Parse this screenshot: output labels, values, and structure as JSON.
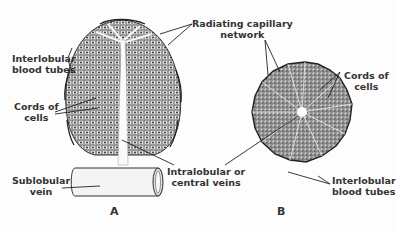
{
  "figure": {
    "panels": [
      {
        "id": "A",
        "caption": "A",
        "view": "longitudinal section of liver lobule"
      },
      {
        "id": "B",
        "caption": "B",
        "view": "cross section of liver lobule"
      }
    ],
    "labels": {
      "radiating_capillary_network": {
        "line1": "Radiating capillary",
        "line2": "network"
      },
      "interlobular_blood_tubes_a": {
        "line1": "Interlobular",
        "line2": "blood tubes"
      },
      "cords_of_cells_a": {
        "line1": "Cords of",
        "line2": "cells"
      },
      "sublobular_vein": {
        "line1": "Sublobular",
        "line2": "vein"
      },
      "intralobular_veins": {
        "line1": "Intralobular or",
        "line2": "central veins"
      },
      "cords_of_cells_b": {
        "line1": "Cords of",
        "line2": "cells"
      },
      "interlobular_blood_tubes_b": {
        "line1": "Interlobular",
        "line2": "blood tubes"
      }
    },
    "colors": {
      "ink": "#2a2a2a",
      "tissue": "#9a9a9a",
      "background": "#fdfdfd"
    }
  }
}
